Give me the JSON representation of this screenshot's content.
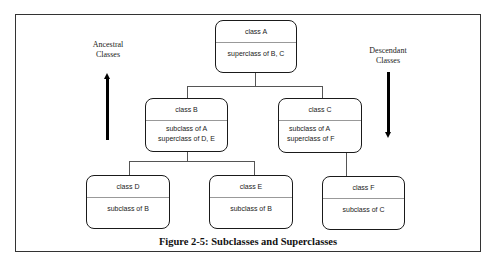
{
  "caption": "Figure 2-5: Subclasses and Superclasses",
  "labels": {
    "ancestral": "Ancestral Classes",
    "descendant": "Descendant Classes"
  },
  "classes": {
    "a": {
      "name": "class A",
      "lines": [
        "superclass of B, C"
      ]
    },
    "b": {
      "name": "class B",
      "lines": [
        "subclass of A",
        "superclass of D, E"
      ]
    },
    "c": {
      "name": "class C",
      "lines": [
        "subclass of A",
        "superclass of F"
      ]
    },
    "d": {
      "name": "class D",
      "lines": [
        "subclass of B"
      ]
    },
    "e": {
      "name": "class E",
      "lines": [
        "subclass of B"
      ]
    },
    "f": {
      "name": "class F",
      "lines": [
        "subclass of C"
      ]
    }
  },
  "arrows": {
    "left": {
      "direction": "up",
      "meaning": "ancestral"
    },
    "right": {
      "direction": "down",
      "meaning": "descendant"
    }
  }
}
